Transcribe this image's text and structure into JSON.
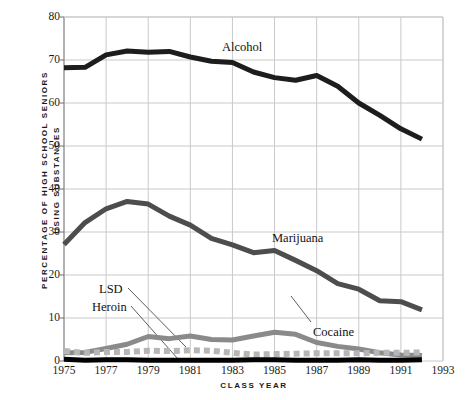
{
  "chart_data": {
    "type": "line",
    "title": "",
    "xlabel": "CLASS YEAR",
    "ylabel_line1": "PERCENTAGE OF HIGH SCHOOL SENIORS",
    "ylabel_line2": "USING SUBSTANCES",
    "ylabel": "PERCENTAGE OF HIGH SCHOOL SENIORS USING SUBSTANCES",
    "xlim": [
      1975,
      1993
    ],
    "ylim": [
      0,
      80
    ],
    "ytick_labels": [
      "0",
      "10",
      "20",
      "30",
      "40",
      "50",
      "60",
      "70",
      "80"
    ],
    "ytick_values": [
      0,
      10,
      20,
      30,
      40,
      50,
      60,
      70,
      80
    ],
    "xtick_labels": [
      "1975",
      "1977",
      "1979",
      "1981",
      "1983",
      "1985",
      "1987",
      "1989",
      "1991",
      "1993"
    ],
    "xtick_values": [
      1975,
      1977,
      1979,
      1981,
      1983,
      1985,
      1987,
      1989,
      1991,
      1993
    ],
    "grid": true,
    "legend_position": "inline-annotations",
    "x": [
      1975,
      1976,
      1977,
      1978,
      1979,
      1980,
      1981,
      1982,
      1983,
      1984,
      1985,
      1986,
      1987,
      1988,
      1989,
      1990,
      1991,
      1992
    ],
    "series": [
      {
        "name": "Alcohol",
        "color": "#1d1d1d",
        "style": "solid",
        "values": [
          68.2,
          68.3,
          71.2,
          72.1,
          71.8,
          72.0,
          70.7,
          69.7,
          69.4,
          67.2,
          65.9,
          65.3,
          66.4,
          63.9,
          60.0,
          57.1,
          54.0,
          51.6
        ]
      },
      {
        "name": "Marijuana",
        "color": "#4d4d4d",
        "style": "solid",
        "values": [
          27.1,
          32.2,
          35.4,
          37.1,
          36.5,
          33.7,
          31.6,
          28.5,
          27.0,
          25.2,
          25.7,
          23.4,
          21.0,
          18.0,
          16.7,
          14.0,
          13.8,
          11.9
        ]
      },
      {
        "name": "Cocaine",
        "color": "#8a8a8a",
        "style": "solid",
        "values": [
          1.9,
          2.0,
          2.9,
          3.9,
          5.7,
          5.2,
          5.8,
          5.0,
          4.9,
          5.8,
          6.7,
          6.2,
          4.3,
          3.4,
          2.8,
          1.9,
          1.4,
          1.3
        ]
      },
      {
        "name": "LSD",
        "color": "#b6b6b6",
        "style": "dashed",
        "values": [
          2.3,
          1.9,
          2.1,
          2.1,
          2.4,
          2.3,
          2.5,
          2.4,
          1.9,
          1.5,
          1.6,
          1.7,
          1.8,
          1.8,
          1.8,
          1.9,
          1.9,
          2.0
        ]
      },
      {
        "name": "Heroin",
        "color": "#000000",
        "style": "solid",
        "values": [
          0.4,
          0.2,
          0.3,
          0.3,
          0.2,
          0.2,
          0.2,
          0.2,
          0.2,
          0.3,
          0.3,
          0.2,
          0.2,
          0.2,
          0.3,
          0.2,
          0.2,
          0.3
        ]
      }
    ],
    "annotations": [
      {
        "text": "Alcohol",
        "x_px": 222,
        "y_px": 41
      },
      {
        "text": "Marijuana",
        "x_px": 272,
        "y_px": 232
      },
      {
        "text": "Cocaine",
        "x_px": 313,
        "y_px": 326
      },
      {
        "text": "LSD",
        "x_px": 99,
        "y_px": 283
      },
      {
        "text": "Heroin",
        "x_px": 92,
        "y_px": 301
      }
    ]
  }
}
